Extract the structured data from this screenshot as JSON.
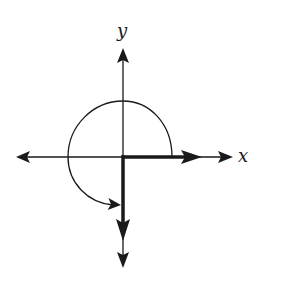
{
  "diagram": {
    "type": "coordinate-axes-rotation",
    "labels": {
      "x_axis": "x",
      "y_axis": "y"
    },
    "colors": {
      "stroke": "#1a1a1a",
      "background": "#ffffff"
    },
    "elements": [
      "x-axis with arrows both ends",
      "y-axis with arrows both ends",
      "bold vector along positive x-axis",
      "bold vector along negative y-axis",
      "circular arc from positive x-axis counterclockwise 270 degrees to negative y-axis, with arrowhead"
    ]
  }
}
